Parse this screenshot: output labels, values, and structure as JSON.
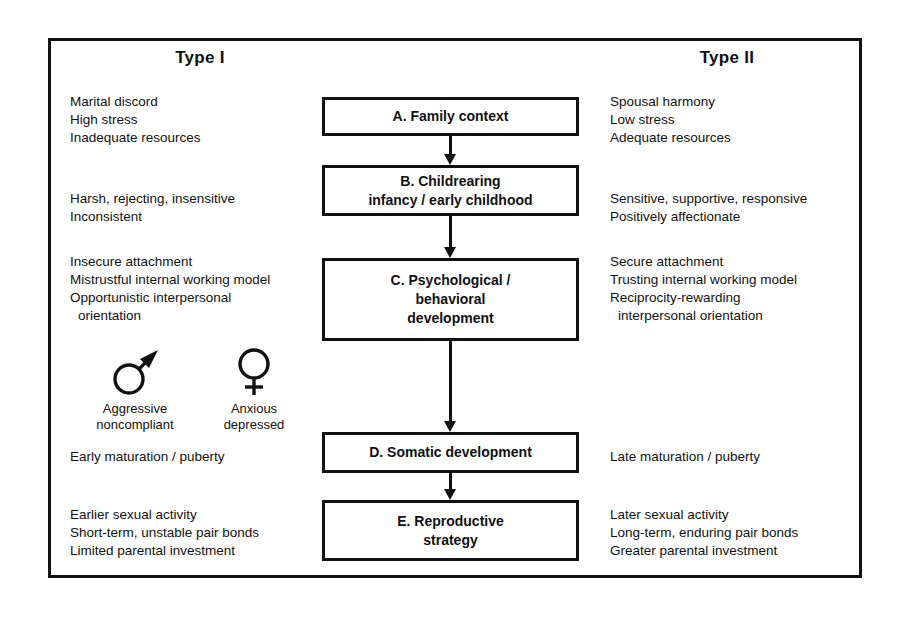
{
  "figure": {
    "type": "flowchart-diagram",
    "columns": {
      "left": {
        "header": "Type I"
      },
      "right": {
        "header": "Type II"
      }
    }
  },
  "left_column": {
    "header": "Type I",
    "blocks": [
      {
        "id": "family-context",
        "lines": [
          "Marital discord",
          "High stress",
          "Inadequate resources"
        ]
      },
      {
        "id": "childrearing",
        "lines": [
          "Harsh, rejecting, insensitive",
          "Inconsistent"
        ]
      },
      {
        "id": "psychological-behavioral",
        "lines": [
          "Insecure attachment",
          "Mistrustful internal working model",
          "Opportunistic interpersonal",
          "orientation"
        ]
      },
      {
        "id": "somatic-development",
        "lines": [
          "Early maturation / puberty"
        ]
      },
      {
        "id": "reproductive-strategy",
        "lines": [
          "Earlier sexual activity",
          "Short-term, unstable pair bonds",
          "Limited parental investment"
        ]
      }
    ],
    "gender_outcomes": [
      {
        "id": "male-outcome",
        "symbol": "male-symbol",
        "symbol_glyph": "♂",
        "lines": [
          "Aggressive",
          "noncompliant"
        ]
      },
      {
        "id": "female-outcome",
        "symbol": "female-symbol",
        "symbol_glyph": "♀",
        "lines": [
          "Anxious",
          "depressed"
        ]
      }
    ]
  },
  "right_column": {
    "header": "Type II",
    "blocks": [
      {
        "id": "family-context",
        "lines": [
          "Spousal harmony",
          "Low stress",
          "Adequate resources"
        ]
      },
      {
        "id": "childrearing",
        "lines": [
          "Sensitive, supportive, responsive",
          "Positively affectionate"
        ]
      },
      {
        "id": "psychological-behavioral",
        "lines": [
          "Secure attachment",
          "Trusting internal working model",
          "Reciprocity-rewarding",
          "interpersonal orientation"
        ]
      },
      {
        "id": "somatic-development",
        "lines": [
          "Late maturation / puberty"
        ]
      },
      {
        "id": "reproductive-strategy",
        "lines": [
          "Later sexual activity",
          "Long-term, enduring pair bonds",
          "Greater parental investment"
        ]
      }
    ]
  },
  "flow": {
    "boxes": [
      {
        "id": "A",
        "lines": [
          "A.  Family context"
        ]
      },
      {
        "id": "B",
        "lines": [
          "B.  Childrearing",
          "infancy / early childhood"
        ]
      },
      {
        "id": "C",
        "lines": [
          "C.  Psychological /",
          "behavioral",
          "development"
        ]
      },
      {
        "id": "D",
        "lines": [
          "D.  Somatic development"
        ]
      },
      {
        "id": "E",
        "lines": [
          "E.  Reproductive",
          "strategy"
        ]
      }
    ],
    "arrows": [
      {
        "id": "A-to-B",
        "from": "A",
        "to": "B",
        "direction": "down"
      },
      {
        "id": "B-to-C",
        "from": "B",
        "to": "C",
        "direction": "down"
      },
      {
        "id": "C-to-D",
        "from": "C",
        "to": "D",
        "direction": "down"
      },
      {
        "id": "D-to-E",
        "from": "D",
        "to": "E",
        "direction": "down"
      }
    ]
  },
  "colors": {
    "ink": "#111111",
    "background": "#ffffff"
  }
}
